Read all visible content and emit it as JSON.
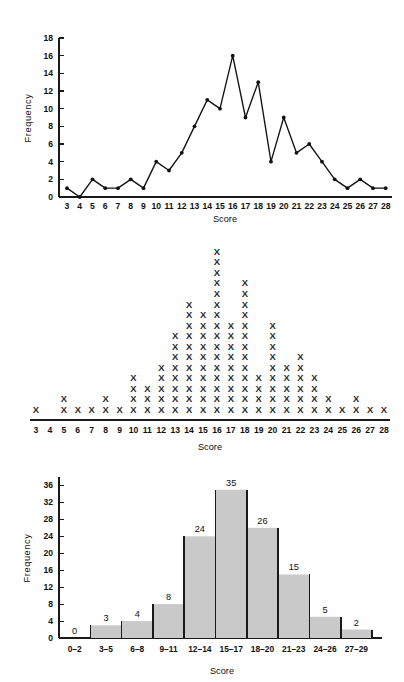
{
  "page": {
    "background": "#ffffff",
    "ink": "#111111",
    "bar_fill": "#c9c9c9"
  },
  "figures": [
    {
      "id": "frequency-polygon",
      "name": "frequency-polygon-chart"
    },
    {
      "id": "dot-plot",
      "name": "dot-plot-chart"
    },
    {
      "id": "histogram",
      "name": "histogram-chart"
    }
  ],
  "chart_data": [
    {
      "type": "line",
      "title": "",
      "xlabel": "Score",
      "ylabel": "Frequency",
      "x": [
        3,
        4,
        5,
        6,
        7,
        8,
        9,
        10,
        11,
        12,
        13,
        14,
        15,
        16,
        17,
        18,
        19,
        20,
        21,
        22,
        23,
        24,
        25,
        26,
        27,
        28
      ],
      "categories": [
        "3",
        "4",
        "5",
        "6",
        "7",
        "8",
        "9",
        "10",
        "11",
        "12",
        "13",
        "14",
        "15",
        "16",
        "17",
        "18",
        "19",
        "20",
        "21",
        "22",
        "23",
        "24",
        "25",
        "26",
        "27",
        "28"
      ],
      "values": [
        1,
        0,
        2,
        1,
        1,
        2,
        1,
        4,
        3,
        5,
        8,
        11,
        10,
        16,
        9,
        13,
        4,
        9,
        5,
        6,
        4,
        2,
        1,
        2,
        1,
        1
      ],
      "ylim": [
        0,
        18
      ],
      "yticks": [
        0,
        2,
        4,
        6,
        8,
        10,
        12,
        14,
        16,
        18
      ],
      "ytick_labels": [
        "0",
        "2",
        "4",
        "6",
        "8",
        "10",
        "12",
        "14",
        "16",
        "18"
      ],
      "grid": false,
      "legend": "none",
      "markers": true,
      "line_color": "#121212"
    },
    {
      "type": "scatter",
      "subtype": "dot-plot",
      "title": "",
      "xlabel": "Score",
      "ylabel": "",
      "marker_glyph": "X",
      "categories": [
        "3",
        "4",
        "5",
        "6",
        "7",
        "8",
        "9",
        "10",
        "11",
        "12",
        "13",
        "14",
        "15",
        "16",
        "17",
        "18",
        "19",
        "20",
        "21",
        "22",
        "23",
        "24",
        "25",
        "26",
        "27",
        "28"
      ],
      "values": [
        1,
        0,
        2,
        1,
        1,
        2,
        1,
        4,
        3,
        5,
        8,
        11,
        10,
        16,
        9,
        13,
        4,
        9,
        5,
        6,
        4,
        2,
        1,
        2,
        1,
        1
      ],
      "ylim": [
        0,
        16
      ],
      "grid": false,
      "legend": "none",
      "marker_color": "#2a2a2a"
    },
    {
      "type": "bar",
      "subtype": "histogram",
      "title": "",
      "xlabel": "Score",
      "ylabel": "Frequency",
      "categories": [
        "0–2",
        "3–5",
        "6–8",
        "9–11",
        "12–14",
        "15–17",
        "18–20",
        "21–23",
        "24–26",
        "27–29"
      ],
      "values": [
        0,
        3,
        4,
        8,
        24,
        35,
        26,
        15,
        5,
        2
      ],
      "data_labels": [
        "0",
        "3",
        "4",
        "8",
        "24",
        "35",
        "26",
        "15",
        "5",
        "2"
      ],
      "ylim": [
        0,
        38
      ],
      "yticks": [
        0,
        4,
        8,
        12,
        16,
        20,
        24,
        28,
        32,
        36
      ],
      "ytick_labels": [
        "0",
        "4",
        "8",
        "12",
        "16",
        "20",
        "24",
        "28",
        "32",
        "36"
      ],
      "grid": false,
      "legend": "none",
      "bar_fill": "#c9c9c9",
      "bar_edge": "#1a1a1a"
    }
  ]
}
